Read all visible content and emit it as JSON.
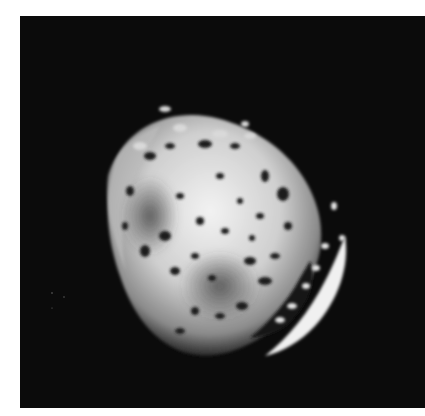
{
  "image": {
    "subject": "cratered moon",
    "description": "Grayscale photograph of a heavily cratered, irregular moon against a black sky",
    "colors": {
      "page": "#ffffff",
      "sky": "#0b0b0b",
      "surface_light": "#e8e8e8",
      "surface_dark": "#1a1a1a"
    }
  }
}
